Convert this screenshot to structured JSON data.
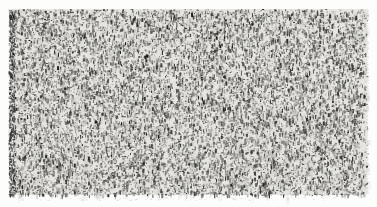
{
  "figure": {
    "kind": "scanned-random-dot-noise-texture",
    "canvas": {
      "width": 377,
      "height": 207
    },
    "background_color": "#fdfdfc",
    "texture": {
      "x": 9,
      "y": 9,
      "width": 359,
      "height": 186,
      "base_color": "#e6e5e1",
      "dot_colors": [
        "#1b1b1a",
        "#343432",
        "#4f4f4c",
        "#6e6e6a",
        "#93928e",
        "#b2b1ac"
      ],
      "dot_density": 0.26,
      "dot_width_px": [
        1,
        2
      ],
      "dot_height_px": [
        1,
        4
      ],
      "vertical_streak_bias": 0.55,
      "edge_jitter_px": 1.2,
      "right_edge_fade_px": 9,
      "left_edge_dense_px": 6,
      "mottle_count": 900,
      "mottle_color": "#8c8c88",
      "smudge_count": 140,
      "smudge_color": "#787873",
      "seed": 1973
    }
  }
}
